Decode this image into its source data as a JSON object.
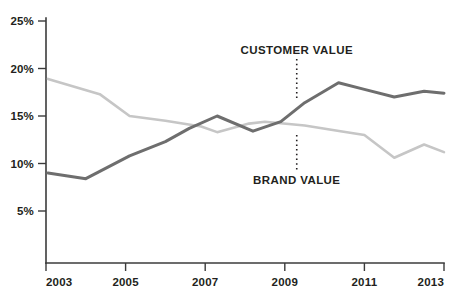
{
  "chart_data": {
    "type": "line",
    "title": "",
    "xlabel": "",
    "ylabel": "",
    "xlim": [
      2003,
      2013
    ],
    "ylim": [
      0,
      25
    ],
    "grid": false,
    "legend_position": "inline-annotations",
    "x_ticks": [
      "2003",
      "2005",
      "2007",
      "2009",
      "2011",
      "2013"
    ],
    "x_tick_values": [
      2003,
      2005,
      2007,
      2009,
      2011,
      2013
    ],
    "y_ticks": [
      "5%",
      "10%",
      "15%",
      "20%",
      "25%"
    ],
    "y_tick_values": [
      5,
      10,
      15,
      20,
      25
    ],
    "series": [
      {
        "name": "CUSTOMER VALUE",
        "color": "#6e6e6e",
        "x": [
          2003.05,
          2004.0,
          2005.1,
          2006.0,
          2006.6,
          2007.3,
          2008.2,
          2008.9,
          2009.5,
          2010.35,
          2011.0,
          2011.75,
          2012.5,
          2013.0
        ],
        "values": [
          9.0,
          8.4,
          10.8,
          12.3,
          13.7,
          15.0,
          13.4,
          14.4,
          16.4,
          18.5,
          17.8,
          17.0,
          17.6,
          17.4
        ]
      },
      {
        "name": "BRAND VALUE",
        "color": "#c6c6c6",
        "x": [
          2003.05,
          2004.35,
          2005.1,
          2006.0,
          2006.9,
          2007.3,
          2008.1,
          2008.5,
          2009.5,
          2010.4,
          2011.0,
          2011.75,
          2012.5,
          2013.0
        ],
        "values": [
          18.9,
          17.3,
          15.0,
          14.5,
          13.9,
          13.3,
          14.2,
          14.4,
          14.0,
          13.4,
          13.0,
          10.6,
          12.0,
          11.2
        ]
      }
    ],
    "annotations": [
      {
        "label": "CUSTOMER VALUE",
        "series": "CUSTOMER VALUE",
        "at_x": 2009.3,
        "text_y_percent": 21.9,
        "leader_from_percent": 21.0,
        "leader_to_percent": 16.6
      },
      {
        "label": "BRAND VALUE",
        "series": "BRAND VALUE",
        "at_x": 2009.3,
        "text_y_percent": 8.3,
        "leader_from_percent": 13.0,
        "leader_to_percent": 9.1
      }
    ]
  }
}
